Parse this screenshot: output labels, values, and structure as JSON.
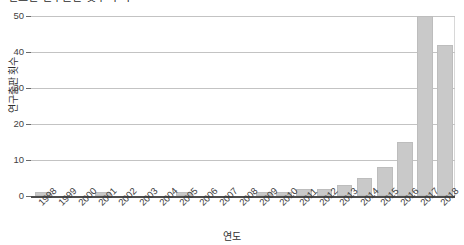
{
  "figure": {
    "title_clipped": "연도별 연구출판 횟수 추이",
    "background_color": "#ffffff",
    "bar_fill_color": "#c9c9c9",
    "bar_edge_color": "#bdbdbd",
    "grid_color": "#c3c3c3",
    "axis_color": "#4c4c4c"
  },
  "chart_data": {
    "type": "bar",
    "title": "연도별 연구출판 횟수 추이",
    "xlabel": "연도",
    "ylabel": "연구출판 횟수",
    "categories": [
      "1998",
      "1999",
      "2000",
      "2001",
      "2002",
      "2003",
      "2004",
      "2005",
      "2006",
      "2007",
      "2008",
      "2009",
      "2010",
      "2011",
      "2012",
      "2013",
      "2014",
      "2015",
      "2016",
      "2017",
      "2018"
    ],
    "values": [
      1,
      0,
      0,
      1,
      0,
      0,
      0,
      1,
      0,
      0,
      0,
      1,
      1,
      2,
      2,
      3,
      5,
      8,
      15,
      50,
      42
    ],
    "ylim": [
      0,
      50
    ],
    "yticks": [
      0,
      10,
      20,
      30,
      40,
      50
    ],
    "ytick_labels": [
      "0",
      "10",
      "20",
      "30",
      "40",
      "50"
    ],
    "grid": true,
    "grid_axis": "y",
    "legend": null,
    "legend_position": "none",
    "series": [
      {
        "name": "연구출판 횟수",
        "values": [
          1,
          0,
          0,
          1,
          0,
          0,
          0,
          1,
          0,
          0,
          0,
          1,
          1,
          2,
          2,
          3,
          5,
          8,
          15,
          50,
          42
        ]
      }
    ]
  }
}
